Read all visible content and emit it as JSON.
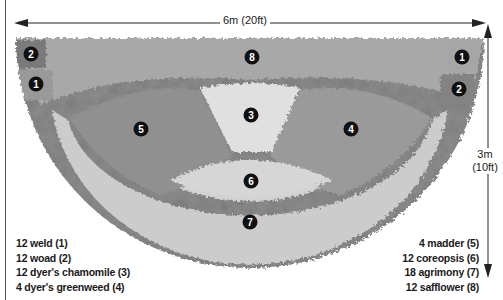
{
  "dimensions": {
    "width_label": "6m (20ft)",
    "height_label_line1": "3m",
    "height_label_line2": "(10ft)"
  },
  "markers": [
    {
      "id": "2",
      "x": 31,
      "y": 54
    },
    {
      "id": "1",
      "x": 36,
      "y": 84
    },
    {
      "id": "8",
      "x": 252,
      "y": 57
    },
    {
      "id": "1",
      "x": 462,
      "y": 57
    },
    {
      "id": "2",
      "x": 459,
      "y": 89
    },
    {
      "id": "5",
      "x": 141,
      "y": 129
    },
    {
      "id": "3",
      "x": 251,
      "y": 115
    },
    {
      "id": "4",
      "x": 351,
      "y": 129
    },
    {
      "id": "6",
      "x": 251,
      "y": 181
    },
    {
      "id": "7",
      "x": 250,
      "y": 222
    }
  ],
  "legend": {
    "left": [
      {
        "text": "12 weld (1)"
      },
      {
        "text": "12 woad (2)"
      },
      {
        "text": "12 dyer's chamomile (3)"
      },
      {
        "text": "4 dyer's greenweed (4)"
      }
    ],
    "right": [
      {
        "text": "4 madder (5)"
      },
      {
        "text": "12 coreopsis (6)"
      },
      {
        "text": "18 agrimony (7)"
      },
      {
        "text": "12 safflower (8)"
      }
    ]
  },
  "colors": {
    "outer_band": "#8a8a8a",
    "back_band": "#a3a3a3",
    "light_band": "#cfcfcf",
    "center": "#dedede",
    "mid_dark": "#8f8f8f"
  }
}
